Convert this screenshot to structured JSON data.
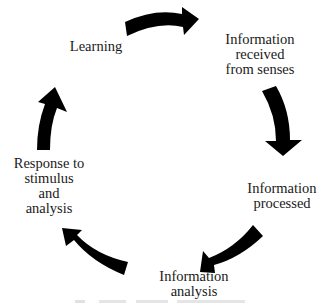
{
  "diagram": {
    "type": "cycle",
    "nodes": [
      {
        "id": "learning",
        "label": "Learning"
      },
      {
        "id": "received",
        "label": "Information received from senses",
        "lines": [
          "Information",
          "received",
          "from senses"
        ]
      },
      {
        "id": "processed",
        "label": "Information processed",
        "lines": [
          "Information",
          "processed"
        ]
      },
      {
        "id": "analysis",
        "label": "Information analysis",
        "lines": [
          "Information",
          "analysis"
        ]
      },
      {
        "id": "response",
        "label": "Response to stimulus and analysis",
        "lines": [
          "Response to",
          "stimulus",
          "and",
          "analysis"
        ]
      }
    ],
    "edges": [
      {
        "from": "learning",
        "to": "received"
      },
      {
        "from": "received",
        "to": "processed"
      },
      {
        "from": "processed",
        "to": "analysis"
      },
      {
        "from": "analysis",
        "to": "response"
      },
      {
        "from": "response",
        "to": "learning"
      }
    ],
    "arrow_color": "#000000"
  }
}
